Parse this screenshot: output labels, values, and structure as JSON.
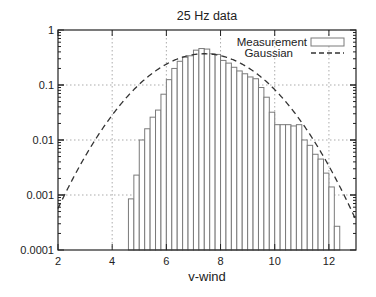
{
  "chart_data": {
    "type": "bar",
    "title": "25 Hz data",
    "xlabel": "v-wind",
    "ylabel": "",
    "xlim": [
      2,
      13
    ],
    "ylim": [
      0.0001,
      1
    ],
    "yscale": "log",
    "grid": true,
    "legend_position": "top-right",
    "x_ticks": [
      2,
      4,
      6,
      8,
      10,
      12
    ],
    "x_tick_labels": [
      "2",
      "4",
      "6",
      "8",
      "10",
      "12"
    ],
    "y_ticks": [
      1,
      0.1,
      0.01,
      0.001,
      0.0001
    ],
    "y_tick_labels": [
      "1",
      "0.1",
      "0.01",
      "0.001",
      "0.0001"
    ],
    "bin_width": 0.2,
    "series": [
      {
        "name": "Measurement",
        "kind": "histogram",
        "x": [
          4.7,
          4.9,
          5.1,
          5.3,
          5.5,
          5.7,
          5.9,
          6.1,
          6.3,
          6.5,
          6.7,
          6.9,
          7.1,
          7.3,
          7.5,
          7.7,
          7.9,
          8.1,
          8.3,
          8.5,
          8.7,
          8.9,
          9.1,
          9.3,
          9.5,
          9.7,
          9.9,
          10.1,
          10.3,
          10.5,
          10.7,
          10.9,
          11.1,
          11.3,
          11.5,
          11.7,
          11.9,
          12.1,
          12.3
        ],
        "values": [
          0.00085,
          0.0023,
          0.01,
          0.016,
          0.026,
          0.035,
          0.068,
          0.125,
          0.2,
          0.27,
          0.32,
          0.34,
          0.43,
          0.46,
          0.45,
          0.37,
          0.36,
          0.28,
          0.25,
          0.21,
          0.18,
          0.16,
          0.14,
          0.13,
          0.09,
          0.06,
          0.032,
          0.019,
          0.019,
          0.019,
          0.018,
          0.019,
          0.01,
          0.008,
          0.0055,
          0.0045,
          0.0025,
          0.0014,
          0.00027
        ]
      },
      {
        "name": "Gaussian",
        "kind": "line",
        "style": "dashed",
        "mean": 7.4,
        "sigma": 1.5,
        "peak": 0.37
      }
    ]
  },
  "colors": {
    "bar_stroke": "#7a7a7a",
    "curve": "#333333",
    "frame": "#222222",
    "grid": "#888888"
  }
}
